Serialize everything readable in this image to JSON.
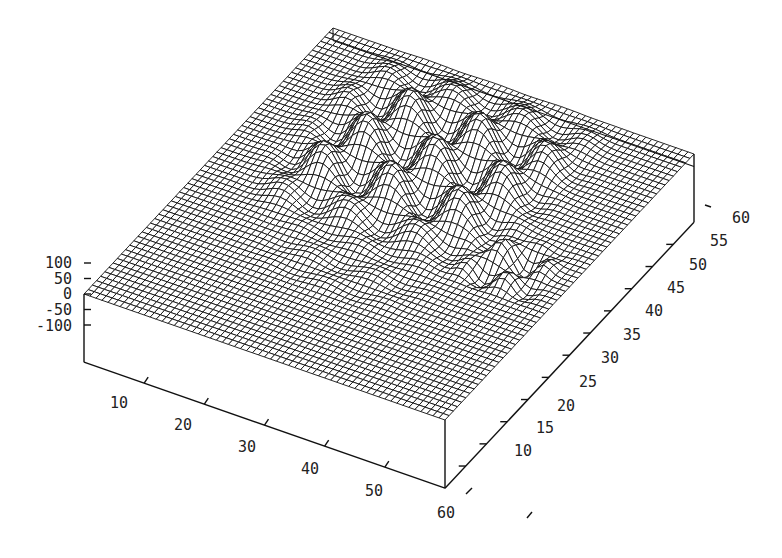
{
  "chart_data": {
    "type": "surface3d",
    "title": "",
    "xlabel": "",
    "ylabel": "",
    "zlabel": "",
    "x_ticks": [
      10,
      20,
      30,
      40,
      50,
      60
    ],
    "y_ticks": [
      10,
      15,
      20,
      25,
      30,
      35,
      40,
      45,
      50,
      55,
      60
    ],
    "z_ticks": [
      100,
      50,
      0,
      -50,
      -100
    ],
    "x_range": [
      0,
      60
    ],
    "y_range": [
      0,
      60
    ],
    "z_range": [
      -100,
      100
    ],
    "grid_resolution": 60,
    "style": "wireframe mesh, hidden-line removed, black on white",
    "surface_description": "Flat plane at z=0 with a central region (x≈5-55, y≈25-55) of wavy sinusoidal ridges and peaks reaching ~+100; lower-amplitude ripples near x≈20-40, y≈15-30; small island of bumps near x≈45-55, y≈25-35.",
    "colors": {
      "line": "#000000",
      "background": "#ffffff"
    }
  },
  "axes": {
    "x_labels": [
      "10",
      "20",
      "30",
      "40",
      "50",
      "60"
    ],
    "y_labels": [
      "10",
      "15",
      "20",
      "25",
      "30",
      "35",
      "40",
      "45",
      "50",
      "55",
      "60"
    ],
    "z_labels": [
      "100",
      "50",
      "0",
      "-50",
      "-100"
    ]
  }
}
